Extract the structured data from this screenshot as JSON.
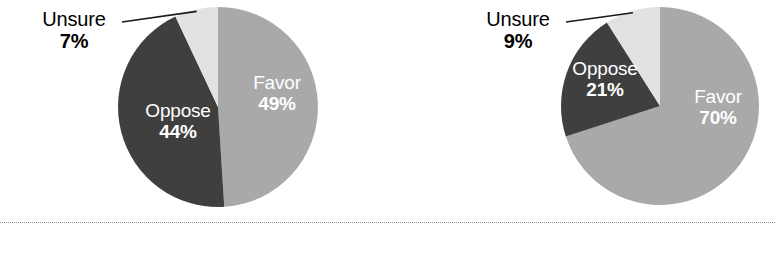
{
  "figure": {
    "background_color": "#ffffff",
    "divider": {
      "name": "dotted-rule",
      "y": 222,
      "color": "#8b8b8b",
      "style": "dotted"
    }
  },
  "colors": {
    "favor": "#a9a9a9",
    "oppose": "#3f3f3f",
    "unsure": "#e2e2e2",
    "inside_label": "#ffffff",
    "outside_label": "#000000",
    "leader_line": "#1a1a1a"
  },
  "chart_data": [
    {
      "type": "pie",
      "id": "pie-left",
      "title": "",
      "center": [
        218,
        107
      ],
      "radius": 100,
      "start_angle_deg": 0,
      "direction": "clockwise",
      "categories": [
        "Favor",
        "Oppose",
        "Unsure"
      ],
      "values": [
        49,
        44,
        7
      ],
      "slices": [
        {
          "label": "Favor",
          "value": 49,
          "value_text": "49%",
          "color": "#a9a9a9",
          "label_position": "inside",
          "label_color": "#ffffff"
        },
        {
          "label": "Oppose",
          "value": 44,
          "value_text": "44%",
          "color": "#3f3f3f",
          "label_position": "inside",
          "label_color": "#ffffff"
        },
        {
          "label": "Unsure",
          "value": 7,
          "value_text": "7%",
          "color": "#e2e2e2",
          "label_position": "outside",
          "label_color": "#000000",
          "leader_line": true
        }
      ]
    },
    {
      "type": "pie",
      "id": "pie-right",
      "title": "",
      "center": [
        660,
        106
      ],
      "radius": 99,
      "start_angle_deg": 0,
      "direction": "clockwise",
      "categories": [
        "Favor",
        "Oppose",
        "Unsure"
      ],
      "values": [
        70,
        21,
        9
      ],
      "slices": [
        {
          "label": "Favor",
          "value": 70,
          "value_text": "70%",
          "color": "#a9a9a9",
          "label_position": "inside",
          "label_color": "#ffffff"
        },
        {
          "label": "Oppose",
          "value": 21,
          "value_text": "21%",
          "color": "#3f3f3f",
          "label_position": "inside",
          "label_color": "#ffffff"
        },
        {
          "label": "Unsure",
          "value": 9,
          "value_text": "9%",
          "color": "#e2e2e2",
          "label_position": "outside",
          "label_color": "#000000",
          "leader_line": true
        }
      ]
    }
  ],
  "labels": {
    "left": {
      "favor_cat": "Favor",
      "favor_pct": "49%",
      "oppose_cat": "Oppose",
      "oppose_pct": "44%",
      "unsure_cat": "Unsure",
      "unsure_pct": "7%"
    },
    "right": {
      "favor_cat": "Favor",
      "favor_pct": "70%",
      "oppose_cat": "Oppose",
      "oppose_pct": "21%",
      "unsure_cat": "Unsure",
      "unsure_pct": "9%"
    }
  }
}
